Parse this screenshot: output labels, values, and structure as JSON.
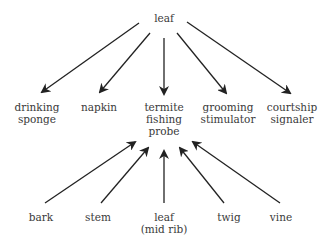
{
  "diagram": {
    "center": {
      "label_lines": [
        "termite",
        "fishing",
        "probe"
      ]
    },
    "top_source": {
      "label": "leaf"
    },
    "uses": [
      {
        "label_lines": [
          "drinking",
          "sponge"
        ]
      },
      {
        "label_lines": [
          "napkin"
        ]
      },
      {
        "label_lines": [
          "termite",
          "fishing",
          "probe"
        ]
      },
      {
        "label_lines": [
          "grooming",
          "stimulator"
        ]
      },
      {
        "label_lines": [
          "courtship",
          "signaler"
        ]
      }
    ],
    "materials": [
      {
        "label_lines": [
          "bark"
        ]
      },
      {
        "label_lines": [
          "stem"
        ]
      },
      {
        "label_lines": [
          "leaf",
          "(mid rib)"
        ]
      },
      {
        "label_lines": [
          "twig"
        ]
      },
      {
        "label_lines": [
          "vine"
        ]
      }
    ],
    "arrow_color": "#222222"
  }
}
